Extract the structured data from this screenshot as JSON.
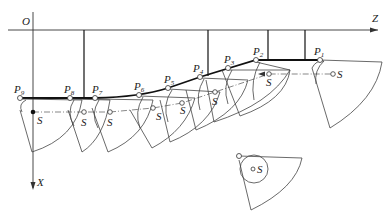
{
  "diagram": {
    "axes": {
      "origin_label": "O",
      "horizontal_label": "Z",
      "vertical_label": "X"
    },
    "points": [
      {
        "id": "P1",
        "base": "P",
        "sub": "1",
        "x": 320,
        "y": 60
      },
      {
        "id": "P2",
        "base": "P",
        "sub": "2",
        "x": 256,
        "y": 60
      },
      {
        "id": "P3",
        "base": "P",
        "sub": "3",
        "x": 228,
        "y": 68
      },
      {
        "id": "P4",
        "base": "P",
        "sub": "4",
        "x": 200,
        "y": 77
      },
      {
        "id": "P5",
        "base": "P",
        "sub": "5",
        "x": 168,
        "y": 88
      },
      {
        "id": "P6",
        "base": "P",
        "sub": "6",
        "x": 139,
        "y": 95
      },
      {
        "id": "P7",
        "base": "P",
        "sub": "7",
        "x": 95,
        "y": 98
      },
      {
        "id": "P8",
        "base": "P",
        "sub": "8",
        "x": 70,
        "y": 98
      },
      {
        "id": "P9",
        "base": "P",
        "sub": "9",
        "x": 20,
        "y": 98
      }
    ],
    "center_labels": [
      {
        "text": "S",
        "x": 33,
        "y": 112
      },
      {
        "text": "S",
        "x": 84,
        "y": 112
      },
      {
        "text": "S",
        "x": 110,
        "y": 112
      },
      {
        "text": "S",
        "x": 153,
        "y": 108
      },
      {
        "text": "S",
        "x": 182,
        "y": 103
      },
      {
        "text": "S",
        "x": 215,
        "y": 92
      },
      {
        "text": "S",
        "x": 269,
        "y": 77
      },
      {
        "text": "S",
        "x": 333,
        "y": 73
      },
      {
        "text": "S",
        "x": 253,
        "y": 169
      }
    ],
    "caption_isolated_tool": "S"
  }
}
